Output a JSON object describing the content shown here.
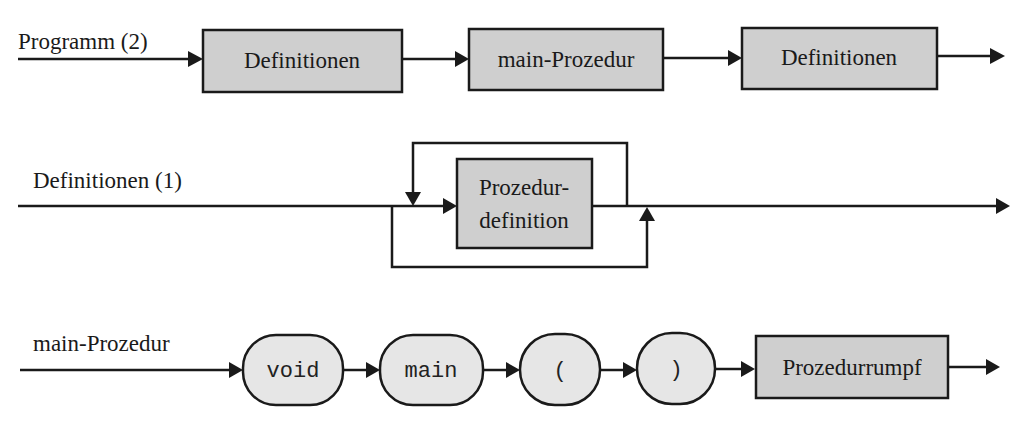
{
  "diagrams": [
    {
      "name": "Programm (2)",
      "elements": [
        {
          "type": "nonterminal",
          "label": "Definitionen"
        },
        {
          "type": "nonterminal",
          "label": "main-Prozedur"
        },
        {
          "type": "nonterminal",
          "label": "Definitionen"
        }
      ]
    },
    {
      "name": "Definitionen (1)",
      "elements": [
        {
          "type": "nonterminal",
          "label_line1": "Prozedur-",
          "label_line2": "definition"
        }
      ],
      "structure": "optional repetition (loop back and bypass)"
    },
    {
      "name": "main-Prozedur",
      "elements": [
        {
          "type": "terminal",
          "label": "void"
        },
        {
          "type": "terminal",
          "label": "main"
        },
        {
          "type": "terminal",
          "label": "("
        },
        {
          "type": "terminal",
          "label": ")"
        },
        {
          "type": "nonterminal",
          "label": "Prozedurrumpf"
        }
      ]
    }
  ],
  "colors": {
    "nonterminal_fill": "#cfcfcf",
    "terminal_fill": "#e6e6e6",
    "stroke": "#1a1a1a"
  }
}
